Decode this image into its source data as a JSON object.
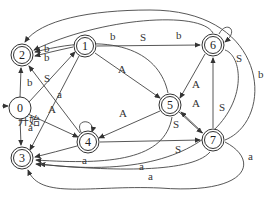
{
  "diagram": {
    "type": "state-transition-diagram",
    "start_label": "开始",
    "nodes": [
      {
        "id": "0",
        "label": "0",
        "x": 20,
        "y": 108,
        "accepting": false
      },
      {
        "id": "1",
        "label": "1",
        "x": 85,
        "y": 46,
        "accepting": true
      },
      {
        "id": "2",
        "label": "2",
        "x": 22,
        "y": 55,
        "accepting": true
      },
      {
        "id": "3",
        "label": "3",
        "x": 22,
        "y": 158,
        "accepting": true
      },
      {
        "id": "4",
        "label": "4",
        "x": 88,
        "y": 142,
        "accepting": true
      },
      {
        "id": "5",
        "label": "5",
        "x": 170,
        "y": 105,
        "accepting": true
      },
      {
        "id": "6",
        "label": "6",
        "x": 213,
        "y": 45,
        "accepting": true
      },
      {
        "id": "7",
        "label": "7",
        "x": 213,
        "y": 140,
        "accepting": true
      }
    ],
    "edges": [
      {
        "from": "0",
        "to": "2",
        "label": "b"
      },
      {
        "from": "0",
        "to": "1",
        "label": "S"
      },
      {
        "from": "0",
        "to": "4",
        "label": "A"
      },
      {
        "from": "0",
        "to": "3",
        "label": "a"
      },
      {
        "from": "1",
        "to": "2",
        "label": "b"
      },
      {
        "from": "1",
        "to": "6",
        "label": "S"
      },
      {
        "from": "1",
        "to": "5",
        "label": "A"
      },
      {
        "from": "1",
        "to": "3",
        "label": "a"
      },
      {
        "from": "4",
        "to": "2",
        "label": "b"
      },
      {
        "from": "4",
        "to": "4",
        "label": "A"
      },
      {
        "from": "4",
        "to": "3",
        "label": "a"
      },
      {
        "from": "5",
        "to": "2",
        "label": "b"
      },
      {
        "from": "5",
        "to": "4",
        "label": "A"
      },
      {
        "from": "5",
        "to": "7",
        "label": "S"
      },
      {
        "from": "5",
        "to": "3",
        "label": "a"
      },
      {
        "from": "6",
        "to": "6",
        "label": "S"
      },
      {
        "from": "6",
        "to": "5",
        "label": "A"
      },
      {
        "from": "6",
        "to": "2",
        "label": "b"
      },
      {
        "from": "6",
        "to": "3",
        "label": "a"
      },
      {
        "from": "7",
        "to": "6",
        "label": "S"
      },
      {
        "from": "7",
        "to": "5",
        "label": "A"
      },
      {
        "from": "7",
        "to": "2",
        "label": "b"
      },
      {
        "from": "7",
        "to": "3",
        "label": "a"
      },
      {
        "from": "4",
        "to": "7",
        "label": "S"
      }
    ]
  }
}
